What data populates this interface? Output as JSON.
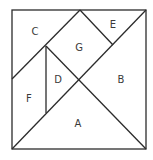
{
  "diagram": {
    "type": "tangram",
    "stroke_color": "#2b2b2b",
    "fill_color": "#ffffff",
    "outer_square": {
      "x": 12,
      "y": 10,
      "width": 134,
      "height": 139
    },
    "lines": [
      {
        "id": "diag-main",
        "x1": 12,
        "y1": 149,
        "x2": 146,
        "y2": 10
      },
      {
        "id": "diag-anti-lower",
        "x1": 46,
        "y1": 46,
        "x2": 146,
        "y2": 149
      },
      {
        "id": "c-edge",
        "x1": 12,
        "y1": 79,
        "x2": 80,
        "y2": 10
      },
      {
        "id": "e-edge",
        "x1": 80,
        "y1": 10,
        "x2": 113,
        "y2": 45
      },
      {
        "id": "d-f-divider",
        "x1": 46,
        "y1": 46,
        "x2": 46,
        "y2": 113
      }
    ],
    "pieces": [
      {
        "label": "A",
        "x": 78,
        "y": 124
      },
      {
        "label": "B",
        "x": 121,
        "y": 80
      },
      {
        "label": "C",
        "x": 35,
        "y": 32
      },
      {
        "label": "D",
        "x": 58,
        "y": 80
      },
      {
        "label": "E",
        "x": 113,
        "y": 25
      },
      {
        "label": "F",
        "x": 29,
        "y": 99
      },
      {
        "label": "G",
        "x": 79,
        "y": 48
      }
    ]
  }
}
